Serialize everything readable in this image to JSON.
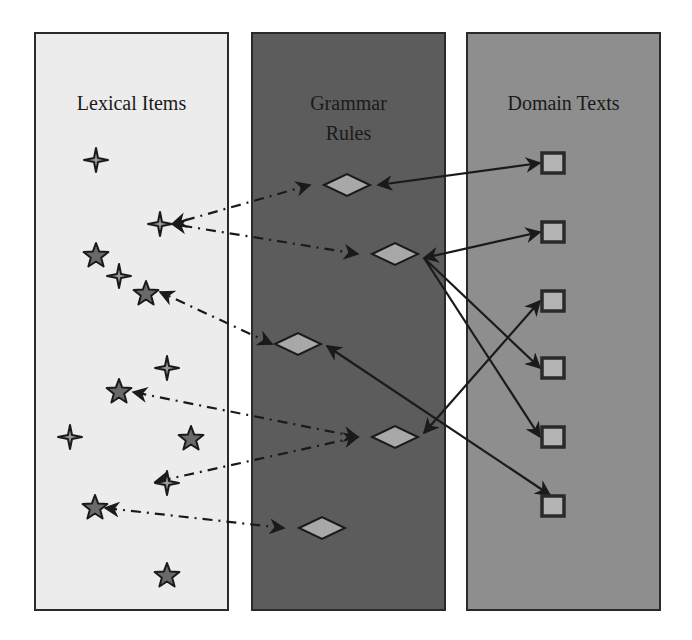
{
  "diagram": {
    "panels": [
      {
        "id": "lexical",
        "title_lines": [
          "Lexical Items"
        ],
        "x": 35,
        "y": 33,
        "w": 193,
        "h": 577,
        "fill": "#ececec",
        "title_y": [
          110
        ]
      },
      {
        "id": "grammar",
        "title_lines": [
          "Grammar",
          "Rules"
        ],
        "x": 252,
        "y": 33,
        "w": 193,
        "h": 577,
        "fill": "#5c5c5c",
        "title_y": [
          110,
          140
        ],
        "title_color": "#1e1e1e"
      },
      {
        "id": "domain",
        "title_lines": [
          "Domain Texts"
        ],
        "x": 467,
        "y": 33,
        "w": 193,
        "h": 577,
        "fill": "#8e8e8e",
        "title_y": [
          110
        ]
      }
    ],
    "lexical_items": [
      {
        "type": "sparkle",
        "x": 96,
        "y": 160
      },
      {
        "type": "sparkle",
        "x": 160,
        "y": 224
      },
      {
        "type": "star",
        "x": 96,
        "y": 256
      },
      {
        "type": "sparkle",
        "x": 119,
        "y": 276
      },
      {
        "type": "star",
        "x": 146,
        "y": 294
      },
      {
        "type": "sparkle",
        "x": 167,
        "y": 368
      },
      {
        "type": "star",
        "x": 119,
        "y": 392
      },
      {
        "type": "sparkle",
        "x": 70,
        "y": 437
      },
      {
        "type": "star",
        "x": 191,
        "y": 439
      },
      {
        "type": "sparkle",
        "x": 167,
        "y": 483
      },
      {
        "type": "star",
        "x": 95,
        "y": 508
      },
      {
        "type": "star",
        "x": 167,
        "y": 576
      }
    ],
    "grammar_rules": [
      {
        "id": "g1",
        "x": 347,
        "y": 185
      },
      {
        "id": "g2",
        "x": 395,
        "y": 254
      },
      {
        "id": "g3",
        "x": 298,
        "y": 344
      },
      {
        "id": "g4",
        "x": 395,
        "y": 437
      },
      {
        "id": "g5",
        "x": 322,
        "y": 528
      }
    ],
    "domain_texts": [
      {
        "id": "d1",
        "x": 553,
        "y": 163
      },
      {
        "id": "d2",
        "x": 553,
        "y": 232
      },
      {
        "id": "d3",
        "x": 553,
        "y": 301
      },
      {
        "id": "d4",
        "x": 553,
        "y": 368
      },
      {
        "id": "d5",
        "x": 553,
        "y": 437
      },
      {
        "id": "d6",
        "x": 553,
        "y": 506
      }
    ],
    "dashed_links": [
      {
        "from": [
          310,
          185
        ],
        "to": [
          172,
          224
        ]
      },
      {
        "from": [
          358,
          254
        ],
        "to": [
          172,
          224
        ]
      },
      {
        "from": [
          272,
          344
        ],
        "to": [
          160,
          292
        ]
      },
      {
        "from": [
          358,
          437
        ],
        "to": [
          133,
          392
        ]
      },
      {
        "from": [
          358,
          437
        ],
        "to": [
          155,
          482
        ]
      },
      {
        "from": [
          284,
          528
        ],
        "to": [
          105,
          508
        ]
      }
    ],
    "solid_links": [
      {
        "from": [
          378,
          185
        ],
        "to": [
          540,
          163
        ],
        "bidirectional": true
      },
      {
        "from": [
          424,
          258
        ],
        "to": [
          540,
          232
        ],
        "bidirectional": true
      },
      {
        "from": [
          424,
          258
        ],
        "to": [
          540,
          368
        ],
        "bidirectional": false
      },
      {
        "from": [
          424,
          258
        ],
        "to": [
          540,
          437
        ],
        "bidirectional": false
      },
      {
        "from": [
          424,
          433
        ],
        "to": [
          540,
          301
        ],
        "bidirectional": true
      },
      {
        "from": [
          327,
          346
        ],
        "to": [
          550,
          495
        ],
        "bidirectional": true
      }
    ],
    "colors": {
      "stroke": "#1a1a1a",
      "diamond_fill": "#a8a8a8",
      "square_fill": "#b4b4b4",
      "star_fill": "#6a6a6a",
      "sparkle_fill": "#9a9a9a"
    }
  }
}
